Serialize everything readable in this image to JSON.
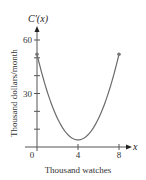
{
  "chart_data": {
    "type": "line",
    "title": "",
    "function_label": "C′(x)",
    "x_axis_symbol": "x",
    "xlabel": "Thousand watches",
    "ylabel": "Thousand dollars/month",
    "xlim": [
      0,
      8
    ],
    "ylim": [
      0,
      60
    ],
    "x_ticks": [
      0,
      1,
      2,
      3,
      4,
      5,
      6,
      7,
      8
    ],
    "x_tick_labels": [
      {
        "value": 0,
        "label": "0"
      },
      {
        "value": 4,
        "label": "4"
      },
      {
        "value": 8,
        "label": "8"
      }
    ],
    "y_ticks": [
      10,
      20,
      30,
      40,
      50,
      60
    ],
    "y_tick_labels": [
      {
        "value": 30,
        "label": "30"
      },
      {
        "value": 60,
        "label": "60"
      }
    ],
    "grid": false,
    "series": [
      {
        "name": "C'(x)",
        "formula": "3x^2 - 24x + 52",
        "x": [
          0,
          1,
          2,
          3,
          4,
          5,
          6,
          7,
          8
        ],
        "y": [
          52,
          31,
          16,
          7,
          4,
          7,
          16,
          31,
          52
        ],
        "color": "#6b6b6b",
        "endpoints": [
          [
            0,
            52
          ],
          [
            8,
            52
          ]
        ]
      }
    ]
  }
}
